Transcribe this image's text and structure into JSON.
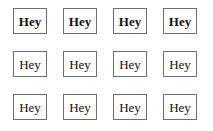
{
  "canvas": {
    "width": 213,
    "height": 131,
    "background_color": "#ffffff"
  },
  "style": {
    "border_color": "#6f6f6f",
    "text_color": "#111111",
    "box_background": "#ffffff"
  },
  "grid": {
    "columns": 4,
    "rows": 3,
    "cells": [
      {
        "label": "Hey",
        "weight": "bold",
        "row": 1,
        "column": 1
      },
      {
        "label": "Hey",
        "weight": "bold",
        "row": 1,
        "column": 2
      },
      {
        "label": "Hey",
        "weight": "bold",
        "row": 1,
        "column": 3
      },
      {
        "label": "Hey",
        "weight": "bold",
        "row": 1,
        "column": 4
      },
      {
        "label": "Hey",
        "weight": "regular",
        "row": 2,
        "column": 1
      },
      {
        "label": "Hey",
        "weight": "regular",
        "row": 2,
        "column": 2
      },
      {
        "label": "Hey",
        "weight": "regular",
        "row": 2,
        "column": 3
      },
      {
        "label": "Hey",
        "weight": "regular",
        "row": 2,
        "column": 4
      },
      {
        "label": "Hey",
        "weight": "regular",
        "row": 3,
        "column": 1
      },
      {
        "label": "Hey",
        "weight": "regular",
        "row": 3,
        "column": 2
      },
      {
        "label": "Hey",
        "weight": "regular",
        "row": 3,
        "column": 3
      },
      {
        "label": "Hey",
        "weight": "regular",
        "row": 3,
        "column": 4
      }
    ]
  }
}
